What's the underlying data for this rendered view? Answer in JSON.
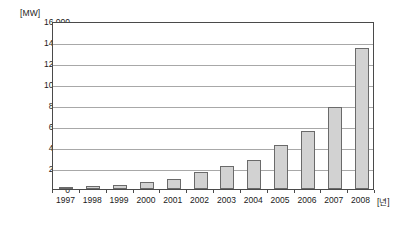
{
  "chart_data": {
    "type": "bar",
    "title": "",
    "xlabel": "[년]",
    "ylabel": "[MW]",
    "categories": [
      "1997",
      "1998",
      "1999",
      "2000",
      "2001",
      "2002",
      "2003",
      "2004",
      "2005",
      "2006",
      "2007",
      "2008"
    ],
    "values": [
      200,
      250,
      400,
      650,
      1000,
      1600,
      2200,
      2800,
      4200,
      5500,
      7800,
      13400
    ],
    "ylim": [
      0,
      16000
    ],
    "ytick_values": [
      0,
      2000,
      4000,
      6000,
      8000,
      10000,
      12000,
      14000,
      16000
    ],
    "ytick_labels": [
      "0",
      "2,000",
      "4,000",
      "6,000",
      "8,000",
      "10,000",
      "12,000",
      "14,000",
      "16,000"
    ],
    "grid": true,
    "legend": "none",
    "series": [
      {
        "name": "capacity",
        "values": [
          200,
          250,
          400,
          650,
          1000,
          1600,
          2200,
          2800,
          4200,
          5500,
          7800,
          13400
        ]
      }
    ],
    "colors": {
      "bar_fill": "#d2d2d2",
      "bar_border": "#6a6a6a",
      "gridline": "#a8a8a8",
      "axis": "#4a4a4a",
      "text": "#1a1a1a",
      "background": "#ffffff"
    }
  }
}
